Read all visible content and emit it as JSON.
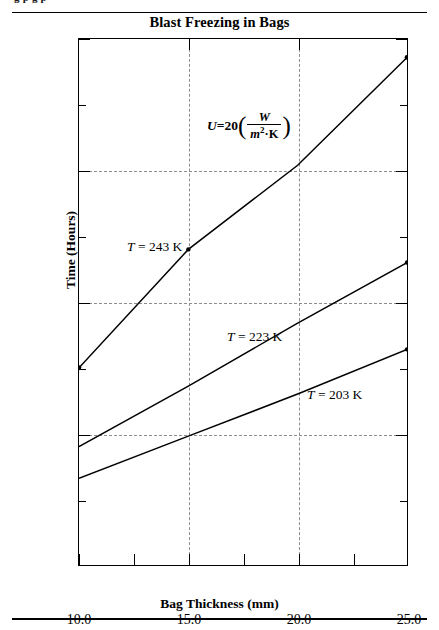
{
  "page": {
    "top_cropped_text": "g   p   g   p",
    "bottom_rule": true
  },
  "chart_data": {
    "type": "line",
    "title": "Blast Freezing in Bags",
    "xlabel": "Bag Thickness (mm)",
    "ylabel": "Time (Hours)",
    "xlim": [
      10.0,
      25.0
    ],
    "ylim": [
      0.0,
      2.0
    ],
    "grid": true,
    "legend_position": "inline-annotations",
    "x_ticks": [
      "10.0",
      "15.0",
      "20.0",
      "25.0"
    ],
    "x_tick_values": [
      10.0,
      15.0,
      20.0,
      25.0
    ],
    "x_minor_tick_values": [
      12.5,
      17.5,
      22.5
    ],
    "y_ticks": [
      "0.0",
      "0.5",
      "1.0",
      "1.5",
      "2.0"
    ],
    "y_tick_values": [
      0.0,
      0.5,
      1.0,
      1.5,
      2.0
    ],
    "y_minor_tick_values": [
      0.25,
      0.75,
      1.25,
      1.75
    ],
    "annotation": {
      "text": "U = 20 (W / m^2 K)",
      "u_symbol": "U",
      "equals": "=",
      "value": "20",
      "numerator": "W",
      "denominator_base": "m",
      "denominator_exp": "2",
      "denominator_dot": "·",
      "denominator_unit": "K"
    },
    "x": [
      10.0,
      15.0,
      20.0,
      25.0
    ],
    "series": [
      {
        "name": "T = 243 K",
        "label_T": "T",
        "label_eq": "=",
        "label_value": "243",
        "label_unit": "K",
        "temperature_K": 243,
        "values": [
          0.75,
          1.2,
          1.52,
          1.93
        ],
        "color": "#000000"
      },
      {
        "name": "T = 223 K",
        "label_T": "T",
        "label_eq": "=",
        "label_value": "223",
        "label_unit": "K",
        "temperature_K": 223,
        "values": [
          0.45,
          0.68,
          0.92,
          1.15
        ],
        "color": "#000000"
      },
      {
        "name": "T = 203 K",
        "label_T": "T",
        "label_eq": "=",
        "label_value": "203",
        "label_unit": "K",
        "temperature_K": 203,
        "values": [
          0.33,
          0.49,
          0.65,
          0.82
        ],
        "color": "#000000"
      }
    ]
  }
}
